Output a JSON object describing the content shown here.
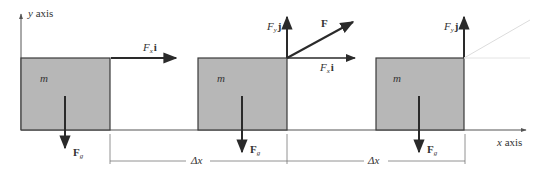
{
  "diagram": {
    "axes": {
      "y_label": "y axis",
      "x_label": "x axis"
    },
    "colors": {
      "box_fill": "#b7b7b7",
      "box_stroke": "#3a3a3a",
      "arrow": "#2a2a2a",
      "faint": "#dcdcdc",
      "background": "#ffffff"
    },
    "blocks": [
      {
        "mass_label": "m",
        "weight_label": {
          "main": "F",
          "sub": "g"
        },
        "forces": [
          {
            "type": "horizontal",
            "main": "F",
            "sub": "x",
            "unit": "i"
          }
        ]
      },
      {
        "mass_label": "m",
        "weight_label": {
          "main": "F",
          "sub": "g"
        },
        "forces": [
          {
            "type": "vertical",
            "main": "F",
            "sub": "y",
            "unit": "j"
          },
          {
            "type": "resultant",
            "main": "F"
          },
          {
            "type": "horizontal",
            "main": "F",
            "sub": "x",
            "unit": "i"
          }
        ]
      },
      {
        "mass_label": "m",
        "weight_label": {
          "main": "F",
          "sub": "g"
        },
        "forces": [
          {
            "type": "vertical",
            "main": "F",
            "sub": "y",
            "unit": "j"
          }
        ]
      }
    ],
    "displacements": [
      {
        "label": "Δx"
      },
      {
        "label": "Δx"
      }
    ]
  }
}
